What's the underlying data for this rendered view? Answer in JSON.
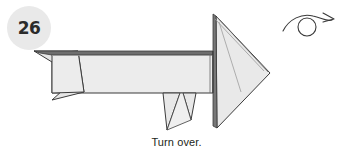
{
  "step": {
    "number": "26",
    "badge_bg": "#e9e9e9",
    "badge_text_color": "#2b2b2b"
  },
  "caption": {
    "text": "Turn over."
  },
  "symbol": {
    "name": "turn-over-arrow",
    "description": "loop arrow over small circle",
    "stroke_color": "#3a3a3a"
  },
  "diagram": {
    "paper_fill": "#ececec",
    "paper_fill_shaded": "#e2e2e2",
    "paper_fill_light": "#f2f2f2",
    "edge_color": "#3b3b3b",
    "fold_color": "#8a8a8a",
    "dark_edge_color": "#555555",
    "parts": [
      {
        "name": "body-panel",
        "label": "main body"
      },
      {
        "name": "top-folded-edge",
        "label": "top folded edge band"
      },
      {
        "name": "left-tail-upper",
        "label": "left tail upper flap"
      },
      {
        "name": "left-tail-lower",
        "label": "left tail lower flap"
      },
      {
        "name": "left-inner-triangle",
        "label": "left inner triangle"
      },
      {
        "name": "leg-front",
        "label": "front leg spike"
      },
      {
        "name": "leg-rear",
        "label": "rear leg spike"
      },
      {
        "name": "right-fin-main",
        "label": "right triangular fin"
      },
      {
        "name": "right-fin-edge",
        "label": "right fin layered edge"
      },
      {
        "name": "right-fin-lower",
        "label": "right fin lower flap"
      }
    ]
  }
}
